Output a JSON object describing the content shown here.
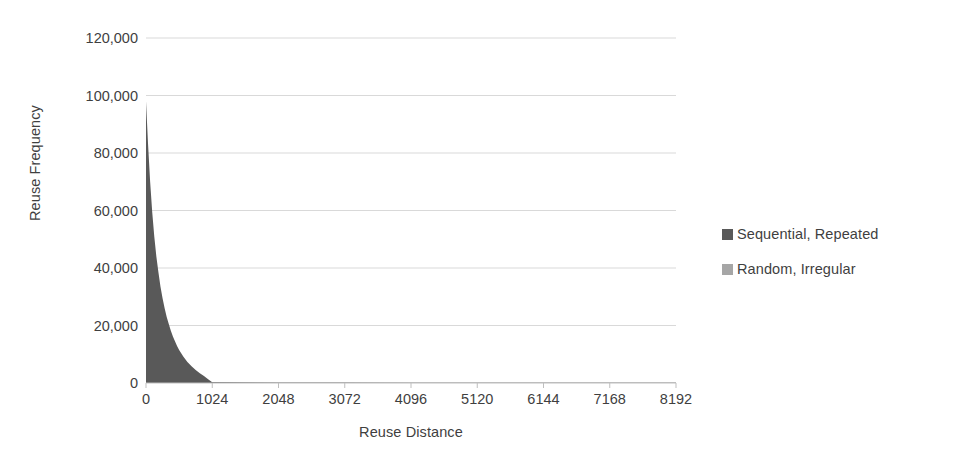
{
  "chart_data": {
    "type": "area",
    "title": "",
    "xlabel": "Reuse Distance",
    "ylabel": "Reuse Frequency",
    "xlim": [
      0,
      8192
    ],
    "ylim": [
      0,
      120000
    ],
    "grid": "horizontal",
    "legend_position": "right",
    "x_tick_labels": [
      "0",
      "1024",
      "2048",
      "3072",
      "4096",
      "5120",
      "6144",
      "7168",
      "8192"
    ],
    "x_ticks": [
      0,
      1024,
      2048,
      3072,
      4096,
      5120,
      6144,
      7168,
      8192
    ],
    "y_tick_labels": [
      "120,000",
      "100,000",
      "80,000",
      "60,000",
      "40,000",
      "20,000",
      "0"
    ],
    "y_ticks": [
      120000,
      100000,
      80000,
      60000,
      40000,
      20000,
      0
    ],
    "series": [
      {
        "name": "Sequential, Repeated",
        "color": "#595959",
        "x": [
          0,
          32,
          64,
          96,
          128,
          160,
          192,
          224,
          256,
          288,
          320,
          352,
          384,
          416,
          448,
          480,
          512,
          576,
          640,
          704,
          768,
          832,
          896,
          960,
          1024,
          2048,
          3072,
          4096,
          5120,
          6144,
          7168,
          8192
        ],
        "values": [
          98000,
          83000,
          70000,
          59500,
          51000,
          44000,
          38500,
          33500,
          29500,
          26000,
          23000,
          20500,
          18200,
          16200,
          14500,
          12900,
          11500,
          9200,
          7300,
          5800,
          4500,
          3400,
          2400,
          1300,
          300,
          0,
          0,
          0,
          0,
          0,
          0,
          0
        ]
      },
      {
        "name": "Random, Irregular",
        "color": "#a6a6a6",
        "x": [
          0,
          1024,
          2048,
          3072,
          4096,
          5120,
          6144,
          7168,
          8192
        ],
        "values": [
          350,
          330,
          320,
          310,
          300,
          300,
          290,
          285,
          280
        ]
      }
    ]
  },
  "axes": {
    "y_title": "Reuse Frequency",
    "x_title": "Reuse Distance"
  },
  "legend": {
    "items": [
      {
        "label": "Sequential, Repeated",
        "color": "#595959"
      },
      {
        "label": "Random, Irregular",
        "color": "#a6a6a6"
      }
    ]
  },
  "colors": {
    "background": "#ffffff",
    "gridline": "#d9d9d9",
    "axis_line": "#bfbfbf",
    "text": "#3f3f3f",
    "series_dark": "#595959",
    "series_light": "#a6a6a6"
  }
}
